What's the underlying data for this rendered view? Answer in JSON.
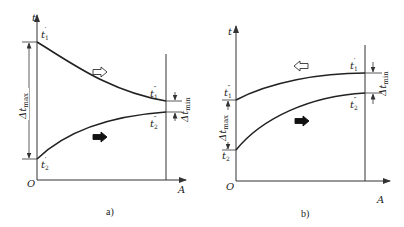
{
  "diagrams": [
    {
      "id": "a",
      "caption": "a)",
      "axis_y_label": "t",
      "axis_x_label": "A",
      "origin_label": "O",
      "labels": {
        "t1_in": {
          "base": "t",
          "sub": "1",
          "sup": "′"
        },
        "t1_out": {
          "base": "t",
          "sub": "1",
          "sup": "″"
        },
        "t2_in": {
          "base": "t",
          "sub": "2",
          "sup": "′"
        },
        "t2_out": {
          "base": "t",
          "sub": "2",
          "sup": "″"
        },
        "dt_max": {
          "base": "Δt",
          "sub": "max"
        },
        "dt_min": {
          "base": "Δt",
          "sub": "min"
        }
      },
      "flow": {
        "hot_fluid_arrow": "right (hollow)",
        "cold_fluid_arrow": "right (solid)"
      },
      "description": "Parallel flow: hot fluid cools from t1′ to t1″, cold fluid heats from t2′ to t2″ along area A"
    },
    {
      "id": "b",
      "caption": "b)",
      "axis_y_label": "t",
      "axis_x_label": "A",
      "origin_label": "O",
      "labels": {
        "t1_in": {
          "base": "t",
          "sub": "1",
          "sup": "′"
        },
        "t1_out": {
          "base": "t",
          "sub": "1",
          "sup": "″"
        },
        "t2_in": {
          "base": "t",
          "sub": "2",
          "sup": "′"
        },
        "t2_out": {
          "base": "t",
          "sub": "2",
          "sup": "″"
        },
        "dt_max": {
          "base": "Δt",
          "sub": "max"
        },
        "dt_min": {
          "base": "Δt",
          "sub": "min"
        }
      },
      "flow": {
        "hot_fluid_arrow": "left (hollow)",
        "cold_fluid_arrow": "right (solid)"
      },
      "description": "Counter flow: hot fluid enters at right (t1′) and exits at left (t1″); cold fluid enters at left (t2′) and exits at right (t2″)"
    }
  ]
}
